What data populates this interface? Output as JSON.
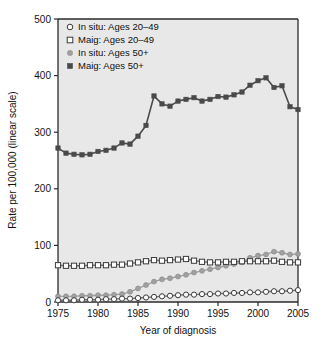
{
  "chart_data": {
    "type": "line",
    "title": "",
    "subtitle": "",
    "xlabel": "Year of diagnosis",
    "ylabel": "Rate per 100,000 (linear scale)",
    "xlim": [
      1975,
      2005
    ],
    "ylim": [
      0,
      500
    ],
    "xticks": [
      1975,
      1980,
      1985,
      1990,
      1995,
      2000,
      2005
    ],
    "xtick_labels": [
      "1975",
      "1980",
      "1985",
      "1990",
      "1995",
      "2000",
      "2005"
    ],
    "yticks": [
      0,
      100,
      200,
      300,
      400,
      500
    ],
    "ytick_labels": [
      "0",
      "100",
      "200",
      "300",
      "400",
      "500"
    ],
    "grid": false,
    "legend_position": "top-left",
    "plot_background": "#e8e8e8",
    "x": [
      1975,
      1976,
      1977,
      1978,
      1979,
      1980,
      1981,
      1982,
      1983,
      1984,
      1985,
      1986,
      1987,
      1988,
      1989,
      1990,
      1991,
      1992,
      1993,
      1994,
      1995,
      1996,
      1997,
      1998,
      1999,
      2000,
      2001,
      2002,
      2003,
      2004,
      2005
    ],
    "series": [
      {
        "name": "In situ: Ages 20–49",
        "marker": "open-circle",
        "color": "#ffffff",
        "edge_color": "#3a3a3a",
        "values": [
          3,
          3,
          3,
          4,
          4,
          4,
          5,
          5,
          6,
          6,
          7,
          8,
          9,
          10,
          11,
          12,
          13,
          13,
          14,
          14,
          15,
          15,
          16,
          16,
          17,
          17,
          18,
          19,
          19,
          20,
          21
        ]
      },
      {
        "name": "Maig: Ages 20–49",
        "marker": "open-square",
        "color": "#ffffff",
        "edge_color": "#3a3a3a",
        "values": [
          65,
          64,
          64,
          64,
          65,
          65,
          65,
          66,
          66,
          68,
          70,
          72,
          74,
          73,
          74,
          75,
          76,
          73,
          71,
          70,
          70,
          71,
          71,
          72,
          72,
          72,
          72,
          73,
          71,
          70,
          70
        ]
      },
      {
        "name": "In situ: Ages 50+",
        "marker": "filled-circle",
        "color": "#a0a0a0",
        "edge_color": "#8a8a8a",
        "values": [
          10,
          10,
          10,
          11,
          11,
          12,
          12,
          13,
          14,
          18,
          24,
          30,
          36,
          40,
          42,
          45,
          48,
          52,
          55,
          58,
          61,
          64,
          67,
          70,
          78,
          82,
          84,
          89,
          87,
          84,
          85
        ]
      },
      {
        "name": "Maig: Ages 50+",
        "marker": "filled-square",
        "color": "#4a4a4a",
        "edge_color": "#4a4a4a",
        "values": [
          272,
          263,
          261,
          260,
          261,
          266,
          268,
          272,
          281,
          279,
          293,
          312,
          364,
          350,
          346,
          355,
          358,
          361,
          355,
          358,
          363,
          362,
          366,
          371,
          383,
          391,
          396,
          379,
          382,
          345,
          340
        ]
      }
    ]
  },
  "legend": {
    "entries": [
      {
        "label": "In situ: Ages 20–49",
        "marker": "open-circle"
      },
      {
        "label": "Maig: Ages 20–49",
        "marker": "open-square"
      },
      {
        "label": "In situ: Ages 50+",
        "marker": "filled-circle"
      },
      {
        "label": "Maig: Ages 50+",
        "marker": "filled-square"
      }
    ]
  },
  "axes": {
    "x_title": "Year of diagnosis",
    "y_title": "Rate per 100,000 (linear scale)",
    "x_tick_labels": [
      "1975",
      "1980",
      "1985",
      "1990",
      "1995",
      "2000",
      "2005"
    ],
    "y_tick_labels": [
      "0",
      "100",
      "200",
      "300",
      "400",
      "500"
    ]
  },
  "colors": {
    "plot_bg": "#e8e8e8",
    "axis": "#2b2b2b",
    "dark_series": "#4a4a4a",
    "gray_series": "#a0a0a0",
    "open_marker_fill": "#ffffff",
    "open_marker_edge": "#3a3a3a",
    "text": "#111111"
  }
}
